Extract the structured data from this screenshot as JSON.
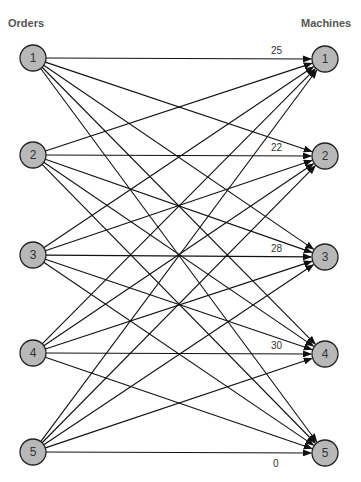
{
  "titles": {
    "left": "Orders",
    "right": "Machines"
  },
  "colors": {
    "node_fill": "#b8b8b8",
    "node_stroke": "#222222",
    "edge": "#111111"
  },
  "orders": [
    {
      "id": "1",
      "x": 33,
      "y": 58
    },
    {
      "id": "2",
      "x": 33,
      "y": 155
    },
    {
      "id": "3",
      "x": 33,
      "y": 255
    },
    {
      "id": "4",
      "x": 33,
      "y": 353
    },
    {
      "id": "5",
      "x": 33,
      "y": 452
    }
  ],
  "machines": [
    {
      "id": "1",
      "x": 325,
      "y": 59,
      "label": "25"
    },
    {
      "id": "2",
      "x": 325,
      "y": 156,
      "label": "22"
    },
    {
      "id": "3",
      "x": 325,
      "y": 257,
      "label": "28"
    },
    {
      "id": "4",
      "x": 325,
      "y": 354,
      "label": "30"
    },
    {
      "id": "5",
      "x": 325,
      "y": 453,
      "label": "0"
    }
  ],
  "edge_labels": [
    {
      "text": "25",
      "x": 271,
      "y": 54
    },
    {
      "text": "22",
      "x": 271,
      "y": 151
    },
    {
      "text": "28",
      "x": 271,
      "y": 252
    },
    {
      "text": "30",
      "x": 271,
      "y": 349
    },
    {
      "text": "0",
      "x": 273,
      "y": 467
    }
  ],
  "node_radius": 13
}
